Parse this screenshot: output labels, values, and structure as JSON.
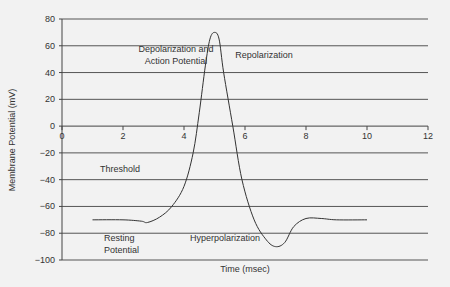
{
  "chart_data": {
    "type": "line",
    "title": "",
    "xlabel": "Time (msec)",
    "ylabel": "Membrane Potential (mV)",
    "xlim": [
      0,
      12
    ],
    "ylim": [
      -100,
      80
    ],
    "x_ticks": [
      0,
      2,
      4,
      6,
      8,
      10,
      12
    ],
    "y_ticks": [
      80,
      60,
      40,
      20,
      0,
      -20,
      -40,
      -60,
      -80,
      -100
    ],
    "x_tick_labels": [
      "0",
      "2",
      "4",
      "6",
      "8",
      "10",
      "12"
    ],
    "y_tick_labels": [
      "80",
      "60",
      "40",
      "20",
      "0",
      "−20",
      "−40",
      "−60",
      "−80",
      "−100"
    ],
    "grid": "horizontal",
    "legend": null,
    "series": [
      {
        "name": "Action potential",
        "x": [
          1,
          2,
          2.6,
          2.8,
          3.2,
          3.6,
          4,
          4.3,
          4.5,
          4.7,
          4.85,
          5,
          5.15,
          5.3,
          5.6,
          5.9,
          6.3,
          6.7,
          7.0,
          7.3,
          7.6,
          8,
          8.5,
          9,
          10
        ],
        "y": [
          -70,
          -70,
          -71,
          -72,
          -68,
          -60,
          -45,
          -20,
          10,
          45,
          65,
          70,
          65,
          40,
          0,
          -40,
          -70,
          -85,
          -90,
          -87,
          -75,
          -69,
          -69,
          -70,
          -70
        ]
      }
    ],
    "annotations": [
      {
        "text": "Depolarization and",
        "x": 4.2,
        "y": 57
      },
      {
        "text": "Action Potential",
        "x": 4.2,
        "y": 50
      },
      {
        "text": "Repolarization",
        "x": 7.0,
        "y": 52
      },
      {
        "text": "Threshold",
        "x": 1.8,
        "y": -33
      },
      {
        "text": "Resting",
        "x": 2.2,
        "y": -85
      },
      {
        "text": "Potential",
        "x": 2.2,
        "y": -92
      },
      {
        "text": "Hyperpolarization",
        "x": 5.3,
        "y": -86
      }
    ]
  }
}
